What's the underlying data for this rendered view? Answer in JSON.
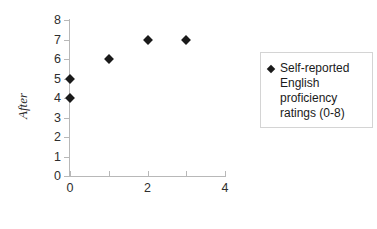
{
  "chart_data": {
    "type": "scatter",
    "title": "",
    "xlabel": "",
    "ylabel": "After",
    "xlim": [
      0,
      4
    ],
    "ylim": [
      0,
      8
    ],
    "grid": false,
    "legend_position": "right",
    "x_ticks": [
      0,
      1,
      2,
      3,
      4
    ],
    "x_tick_labels": [
      "0",
      "",
      "2",
      "",
      "4"
    ],
    "y_ticks": [
      0,
      1,
      2,
      3,
      4,
      5,
      6,
      7,
      8
    ],
    "y_tick_labels": [
      "0",
      "1",
      "2",
      "3",
      "4",
      "5",
      "6",
      "7",
      "8"
    ],
    "marker": "diamond",
    "marker_color": "#1a1a1a",
    "axis_color": "#b8b8b8",
    "background": "#ffffff",
    "series": [
      {
        "name": "Self-reported English proficiency ratings (0-8)",
        "points": [
          {
            "x": 0,
            "y": 5
          },
          {
            "x": 0,
            "y": 4
          },
          {
            "x": 1,
            "y": 6
          },
          {
            "x": 2,
            "y": 7
          },
          {
            "x": 3,
            "y": 7
          }
        ]
      }
    ]
  },
  "axes": {
    "y_title": "After",
    "y_labels": [
      "8",
      "7",
      "6",
      "5",
      "4",
      "3",
      "2",
      "1",
      "0"
    ],
    "x_labels": [
      "0",
      "2",
      "4"
    ]
  },
  "legend": {
    "entry_label": "Self-reported English proficiency ratings (0-8)",
    "marker_name": "diamond-marker"
  }
}
